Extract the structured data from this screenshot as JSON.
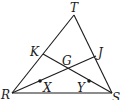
{
  "diagram": {
    "type": "triangle-medians",
    "vertices": {
      "T": {
        "label": "T",
        "x": 74,
        "y": 15
      },
      "R": {
        "label": "R",
        "x": 12,
        "y": 93
      },
      "S": {
        "label": "S",
        "x": 112,
        "y": 93
      }
    },
    "points": {
      "K": {
        "label": "K",
        "x": 43,
        "y": 54
      },
      "J": {
        "label": "J",
        "x": 96,
        "y": 56
      },
      "G": {
        "label": "G",
        "x": 67,
        "y": 68
      },
      "X": {
        "label": "X",
        "x": 40,
        "y": 81
      },
      "Y": {
        "label": "Y",
        "x": 89,
        "y": 81
      }
    },
    "segments": [
      "TR",
      "TS",
      "RS",
      "RJ",
      "SK"
    ],
    "marked_points": [
      "X",
      "Y"
    ]
  }
}
